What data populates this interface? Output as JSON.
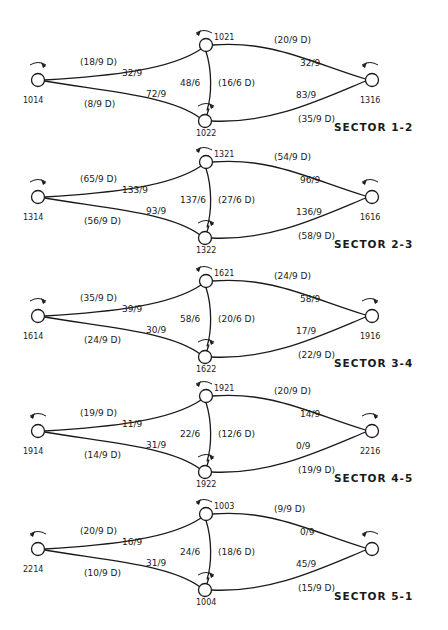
{
  "diagram": {
    "sectors": [
      {
        "label": "SECTOR 1-2",
        "oy": 0,
        "nodes": {
          "left": {
            "id": "1014",
            "arrow": "cw"
          },
          "top": {
            "id": "1021",
            "arrow": "ccw"
          },
          "bottom": {
            "id": "1022",
            "arrow": "cw"
          },
          "right": {
            "id": "1316",
            "arrow": "ccw"
          }
        },
        "edges": {
          "left_top": {
            "flow": "32/9",
            "demand": "(18/9 D)"
          },
          "left_bottom": {
            "flow": "72/9",
            "demand": "(8/9 D)"
          },
          "top_bottom": {
            "flow": "48/6",
            "demand": "(16/6 D)"
          },
          "top_right": {
            "flow": "32/9",
            "demand": "(20/9 D)"
          },
          "bottom_right": {
            "flow": "83/9",
            "demand": "(35/9 D)"
          }
        }
      },
      {
        "label": "SECTOR 2-3",
        "oy": 117,
        "nodes": {
          "left": {
            "id": "1314",
            "arrow": "cw"
          },
          "top": {
            "id": "1321",
            "arrow": "ccw"
          },
          "bottom": {
            "id": "1322",
            "arrow": "cw"
          },
          "right": {
            "id": "1616",
            "arrow": "ccw"
          }
        },
        "edges": {
          "left_top": {
            "flow": "133/9",
            "demand": "(65/9 D)"
          },
          "left_bottom": {
            "flow": "93/9",
            "demand": "(56/9 D)"
          },
          "top_bottom": {
            "flow": "137/6",
            "demand": "(27/6 D)"
          },
          "top_right": {
            "flow": "96/9",
            "demand": "(54/9 D)"
          },
          "bottom_right": {
            "flow": "136/9",
            "demand": "(58/9 D)"
          }
        }
      },
      {
        "label": "SECTOR 3-4",
        "oy": 236,
        "nodes": {
          "left": {
            "id": "1614",
            "arrow": "cw"
          },
          "top": {
            "id": "1621",
            "arrow": "ccw"
          },
          "bottom": {
            "id": "1622",
            "arrow": "cw"
          },
          "right": {
            "id": "1916",
            "arrow": "cw"
          }
        },
        "edges": {
          "left_top": {
            "flow": "39/9",
            "demand": "(35/9 D)"
          },
          "left_bottom": {
            "flow": "30/9",
            "demand": "(24/9 D)"
          },
          "top_bottom": {
            "flow": "58/6",
            "demand": "(20/6 D)"
          },
          "top_right": {
            "flow": "58/9",
            "demand": "(24/9 D)"
          },
          "bottom_right": {
            "flow": "17/9",
            "demand": "(22/9 D)"
          }
        }
      },
      {
        "label": "SECTOR 4-5",
        "oy": 351,
        "nodes": {
          "left": {
            "id": "1914",
            "arrow": "ccw"
          },
          "top": {
            "id": "1921",
            "arrow": "ccw"
          },
          "bottom": {
            "id": "1922",
            "arrow": "cw"
          },
          "right": {
            "id": "2216",
            "arrow": "cw"
          }
        },
        "edges": {
          "left_top": {
            "flow": "11/9",
            "demand": "(19/9 D)"
          },
          "left_bottom": {
            "flow": "31/9",
            "demand": "(14/9 D)"
          },
          "top_bottom": {
            "flow": "22/6",
            "demand": "(12/6 D)"
          },
          "top_right": {
            "flow": "14/9",
            "demand": "(20/9 D)"
          },
          "bottom_right": {
            "flow": "0/9",
            "demand": "(19/9 D)"
          }
        }
      },
      {
        "label": "SECTOR 5-1",
        "oy": 469,
        "nodes": {
          "left": {
            "id": "2214",
            "arrow": "ccw"
          },
          "top": {
            "id": "1003",
            "arrow": "ccw"
          },
          "bottom": {
            "id": "1004",
            "arrow": "cw"
          },
          "right": {
            "id": "",
            "arrow": "ccw"
          }
        },
        "edges": {
          "left_top": {
            "flow": "16/9",
            "demand": "(20/9 D)"
          },
          "left_bottom": {
            "flow": "31/9",
            "demand": "(10/9 D)"
          },
          "top_bottom": {
            "flow": "24/6",
            "demand": "(18/6 D)"
          },
          "top_right": {
            "flow": "0/9",
            "demand": "(9/9 D)"
          },
          "bottom_right": {
            "flow": "45/9",
            "demand": "(15/9 D)"
          }
        }
      }
    ]
  }
}
